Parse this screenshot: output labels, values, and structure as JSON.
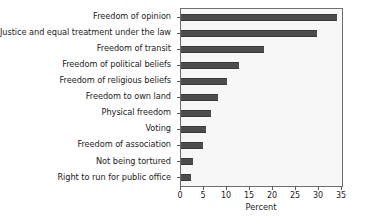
{
  "chart_data": {
    "type": "bar",
    "orientation": "horizontal",
    "title": "",
    "xlabel": "Percent",
    "ylabel": "",
    "xlim": [
      0,
      35
    ],
    "xticks": [
      0,
      5,
      10,
      15,
      20,
      25,
      30,
      35
    ],
    "xticklabels": [
      "0",
      "5",
      "10",
      "15",
      "20",
      "25",
      "30",
      "35"
    ],
    "grid": false,
    "legend": null,
    "bar_color": "#4d4d4d",
    "plot_background": "#f7f7f7",
    "categories": [
      "Freedom of opinion",
      "Justice and equal treatment under the law",
      "Freedom of transit",
      "Freedom of political beliefs",
      "Freedom of religious beliefs",
      "Freedom to own land",
      "Physical freedom",
      "Voting",
      "Freedom of association",
      "Not being tortured",
      "Right to run for public office"
    ],
    "values": [
      33.9,
      29.5,
      18.1,
      12.6,
      9.9,
      8.1,
      6.6,
      5.4,
      4.7,
      2.7,
      2.2
    ]
  }
}
